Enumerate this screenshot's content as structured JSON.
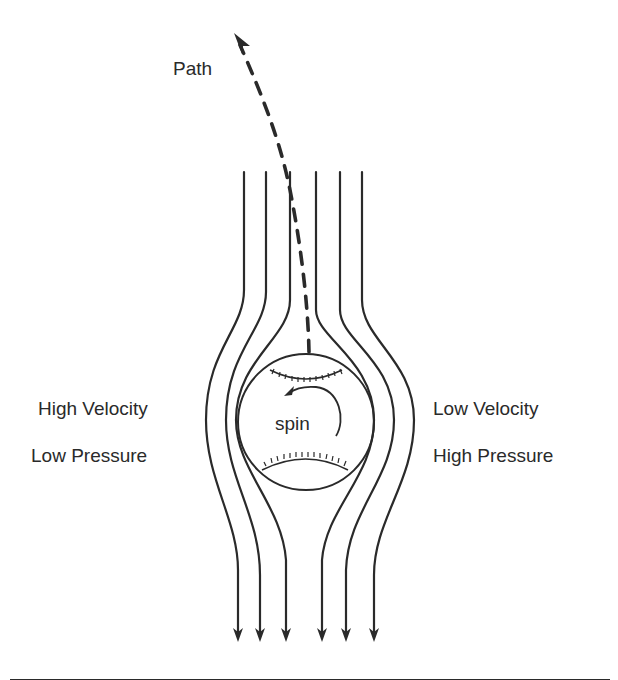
{
  "diagram": {
    "type": "magnus-effect",
    "labels": {
      "path": "Path",
      "spin": "spin",
      "left_line1": "High Velocity",
      "left_line2": "Low Pressure",
      "right_line1": "Low Velocity",
      "right_line2": "High Pressure"
    },
    "streamlines_count": 6,
    "flow_direction": "downward",
    "colors": {
      "ink": "#2a2a2a",
      "background": "#ffffff"
    }
  }
}
